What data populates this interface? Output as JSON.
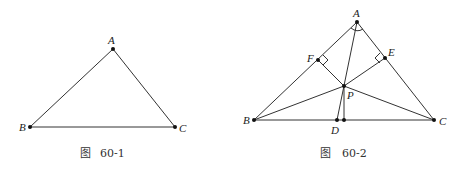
{
  "figures": [
    {
      "id": "fig-60-1",
      "caption_prefix": "图",
      "caption_number": "60-1",
      "points": {
        "A": {
          "label": "A",
          "x": 113,
          "y": 49
        },
        "B": {
          "label": "B",
          "x": 30,
          "y": 127
        },
        "C": {
          "label": "C",
          "x": 175,
          "y": 127
        }
      },
      "segments": [
        [
          "A",
          "B"
        ],
        [
          "A",
          "C"
        ],
        [
          "B",
          "C"
        ]
      ]
    },
    {
      "id": "fig-60-2",
      "caption_prefix": "图",
      "caption_number": "60-2",
      "points": {
        "A": {
          "label": "A",
          "x": 357,
          "y": 22
        },
        "B": {
          "label": "B",
          "x": 254,
          "y": 120
        },
        "C": {
          "label": "C",
          "x": 434,
          "y": 120
        },
        "F": {
          "label": "F",
          "x": 318,
          "y": 60
        },
        "E": {
          "label": "E",
          "x": 385,
          "y": 58
        },
        "P": {
          "label": "P",
          "x": 344,
          "y": 86
        },
        "D": {
          "label": "D",
          "x": 337,
          "y": 120
        },
        "D2": {
          "label": "",
          "x": 344,
          "y": 120
        }
      },
      "segments": [
        [
          "A",
          "B"
        ],
        [
          "A",
          "C"
        ],
        [
          "B",
          "C"
        ],
        [
          "A",
          "D"
        ],
        [
          "P",
          "F"
        ],
        [
          "P",
          "E"
        ],
        [
          "P",
          "B"
        ],
        [
          "P",
          "C"
        ],
        [
          "P",
          "D2"
        ]
      ],
      "right_angles": [
        "F",
        "E"
      ],
      "angle_arc_at": "A"
    }
  ]
}
